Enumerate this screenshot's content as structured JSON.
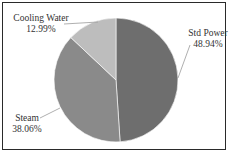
{
  "chart_data": {
    "type": "pie",
    "title": "",
    "slices": [
      {
        "label": "Std Power",
        "value": 48.94,
        "display": "48.94%",
        "color": "#6e6e6e"
      },
      {
        "label": "Steam",
        "value": 38.06,
        "display": "38.06%",
        "color": "#8a8a8a"
      },
      {
        "label": "Cooling Water",
        "value": 12.99,
        "display": "12.99%",
        "color": "#bdbdbd"
      }
    ],
    "start_angle_deg": 0,
    "direction": "clockwise",
    "legend": "none",
    "data_labels": "outside with leader lines"
  },
  "labels": {
    "std_power_name": "Std Power",
    "std_power_pct": "48.94%",
    "steam_name": "Steam",
    "steam_pct": "38.06%",
    "cooling_name": "Cooling Water",
    "cooling_pct": "12.99%"
  }
}
